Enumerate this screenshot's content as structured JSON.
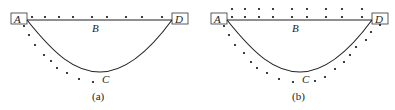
{
  "panels": [
    {
      "id": "a",
      "caption": "(a)",
      "labels": {
        "A": "A",
        "B": "B",
        "C": "C",
        "D": "D"
      },
      "description": "Straight path A-B-D along top and curved path A-C-D; dots along top row and along left/lower side of curve"
    },
    {
      "id": "b",
      "caption": "(b)",
      "labels": {
        "A": "A",
        "B": "B",
        "C": "C",
        "D": "D"
      },
      "description": "Straight path A-B-D along top and curved path A-C-D; two rows of dots above the top line and dots surrounding the curve on both sides"
    }
  ],
  "colors": {
    "stroke": "#222222",
    "background": "#ffffff"
  }
}
